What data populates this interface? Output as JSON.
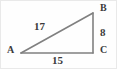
{
  "figure": {
    "kind": "right-triangle-diagram",
    "background_color": "#fefefe",
    "border_color": "#e9e9e9",
    "stroke_color": "#808080",
    "text_color": "#3b3b3b"
  },
  "vertices": [
    {
      "id": "A",
      "label": "A",
      "x": 20,
      "y": 52
    },
    {
      "id": "B",
      "label": "B",
      "x": 92,
      "y": 12
    },
    {
      "id": "C",
      "label": "C",
      "x": 92,
      "y": 52
    }
  ],
  "sides": [
    {
      "id": "hypotenuse",
      "from": "A",
      "to": "B",
      "label": "17"
    },
    {
      "id": "vertical-leg",
      "from": "B",
      "to": "C",
      "label": "8"
    },
    {
      "id": "base-leg",
      "from": "A",
      "to": "C",
      "label": "15"
    }
  ],
  "chart_data": {
    "type": "diagram",
    "title": "",
    "shape": "right triangle",
    "points": {
      "A": [
        20,
        52
      ],
      "B": [
        92,
        12
      ],
      "C": [
        92,
        52
      ]
    },
    "edges": [
      {
        "endpoints": [
          "A",
          "B"
        ],
        "length_label": "17",
        "role": "hypotenuse"
      },
      {
        "endpoints": [
          "B",
          "C"
        ],
        "length_label": "8",
        "role": "leg"
      },
      {
        "endpoints": [
          "A",
          "C"
        ],
        "length_label": "15",
        "role": "leg"
      }
    ],
    "right_angle_at": "C"
  }
}
